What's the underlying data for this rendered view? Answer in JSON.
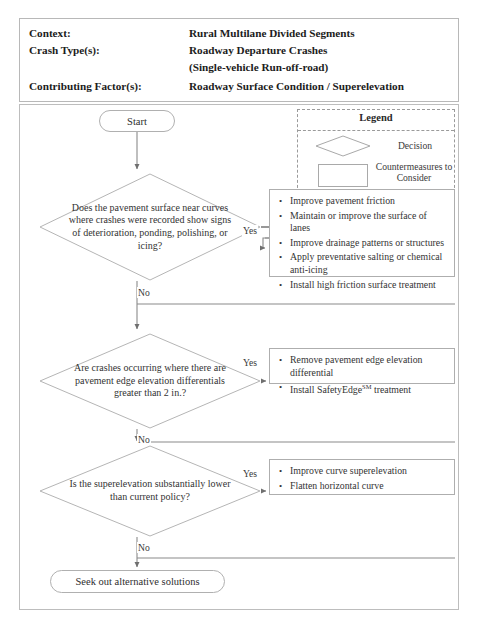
{
  "header": {
    "rows": [
      {
        "label": "Context:",
        "value": "Rural Multilane Divided Segments"
      },
      {
        "label": "Crash Type(s):",
        "value": "Roadway Departure Crashes"
      },
      {
        "label": "",
        "value": "(Single-vehicle Run-off-road)"
      },
      {
        "label": "Contributing Factor(s):",
        "value": "Roadway Surface Condition / Superelevation"
      }
    ]
  },
  "legend": {
    "title": "Legend",
    "decision_label": "Decision",
    "countermeasure_label": "Countermeasures to Consider"
  },
  "flow": {
    "start_label": "Start",
    "end_label": "Seek out alternative solutions",
    "yes_label": "Yes",
    "no_label": "No",
    "decisions": [
      {
        "text": "Does the pavement surface near curves where crashes were recorded show signs of deterioration, ponding, polishing, or icing?"
      },
      {
        "text": "Are crashes occurring where there are  pavement edge elevation differentials greater than 2 in.?"
      },
      {
        "text": "Is the superelevation substantially lower than current policy?"
      }
    ],
    "countermeasures": [
      {
        "items": [
          "Improve pavement friction",
          "Maintain or improve the surface of lanes",
          "Improve drainage patterns or structures",
          "Apply preventative salting or chemical anti-icing",
          "Install high friction surface treatment"
        ]
      },
      {
        "items": [
          "Remove pavement edge elevation differential",
          "Install SafetyEdge<sup>SM</sup> treatment"
        ]
      },
      {
        "items": [
          "Improve curve superelevation",
          "Flatten horizontal curve"
        ]
      }
    ]
  },
  "colors": {
    "border": "#b0b0b0",
    "text": "#333333",
    "line": "#8a8a8a"
  }
}
